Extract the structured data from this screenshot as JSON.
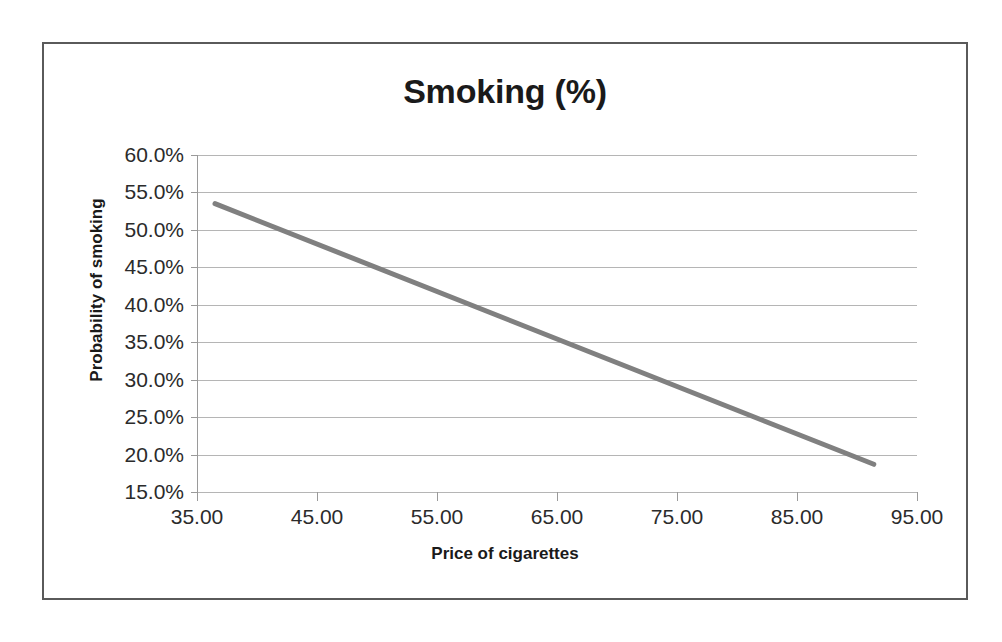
{
  "chart_data": {
    "type": "line",
    "title": "Smoking (%)",
    "xlabel": "Price of cigarettes",
    "ylabel": "Probability of smoking",
    "grid": true,
    "legend": "none",
    "xlim": [
      35.0,
      95.0
    ],
    "ylim": [
      0.15,
      0.6
    ],
    "xticks": [
      35.0,
      45.0,
      55.0,
      65.0,
      75.0,
      85.0,
      95.0
    ],
    "xtick_labels": [
      "35.00",
      "45.00",
      "55.00",
      "65.00",
      "75.00",
      "85.00",
      "95.00"
    ],
    "yticks": [
      0.15,
      0.2,
      0.25,
      0.3,
      0.35,
      0.4,
      0.45,
      0.5,
      0.55,
      0.6
    ],
    "ytick_labels": [
      "15.0%",
      "20.0%",
      "25.0%",
      "30.0%",
      "35.0%",
      "40.0%",
      "45.0%",
      "50.0%",
      "55.0%",
      "60.0%"
    ],
    "series": [
      {
        "name": "Probability of smoking",
        "color": "#808080",
        "line_width": 5,
        "x": [
          36.5,
          91.4
        ],
        "y": [
          0.535,
          0.187
        ],
        "points": [
          {
            "x": 36.5,
            "y": 0.535
          },
          {
            "x": 91.4,
            "y": 0.187
          }
        ]
      }
    ]
  },
  "chart": {
    "title": "Smoking (%)",
    "x_axis_title": "Price of cigarettes",
    "y_axis_title": "Probability of smoking",
    "x_tick_labels": [
      "35.00",
      "45.00",
      "55.00",
      "65.00",
      "75.00",
      "85.00",
      "95.00"
    ],
    "y_tick_labels": [
      "60.0%",
      "55.0%",
      "50.0%",
      "45.0%",
      "40.0%",
      "35.0%",
      "30.0%",
      "25.0%",
      "20.0%",
      "15.0%"
    ]
  },
  "colors": {
    "series_line": "#808080",
    "gridline": "#b5b5b5",
    "axis": "#9a9a9a",
    "frame_border": "#5a5a5a",
    "text": "#1a1a1a",
    "background": "#ffffff"
  }
}
